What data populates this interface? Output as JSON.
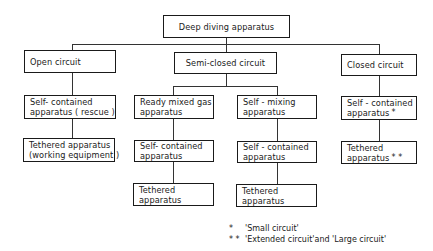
{
  "root": {
    "label": "Deep diving apparatus"
  },
  "branches": [
    {
      "label": "Open circuit",
      "children": [
        {
          "line1": "Self- contained",
          "line2": "apparatus ( rescue )"
        },
        {
          "line1": "Tethered apparatus",
          "line2": "(working equipment )"
        }
      ]
    },
    {
      "label": "Semi-closed circuit",
      "sub": [
        {
          "line1": "Ready mixed gas",
          "line2": "apparatus",
          "children": [
            {
              "line1": "Self- contained",
              "line2": "apparatus"
            },
            {
              "line1": "Tethered",
              "line2": "apparatus"
            }
          ]
        },
        {
          "line1": "Self - mixing",
          "line2": "apparatus",
          "children": [
            {
              "line1": "Self - contained",
              "line2": "apparatus"
            },
            {
              "line1": "Tethered",
              "line2": "apparatus"
            }
          ]
        }
      ]
    },
    {
      "label": "Closed circuit",
      "children": [
        {
          "line1": "Self - contained",
          "line2": "apparatus",
          "mark": "*"
        },
        {
          "line1": "Tethered",
          "line2": "apparatus",
          "mark": "* *"
        }
      ]
    }
  ],
  "legend": [
    {
      "mark": "*",
      "text": "'Small circuit'"
    },
    {
      "mark": "* *",
      "text": "'Extended circuit'and 'Large circuit'"
    }
  ]
}
